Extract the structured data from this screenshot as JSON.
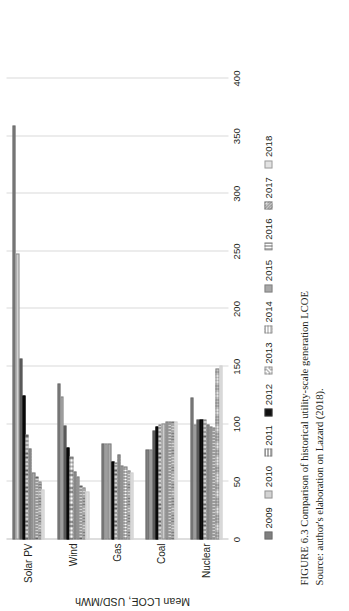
{
  "figure": {
    "number_label": "FIGURE 6.3",
    "caption": "Comparison of historical utility-scale generation LCOE",
    "source": "Source: author's elaboration on Lazard (2018)."
  },
  "chart_data": {
    "type": "bar",
    "orientation": "horizontal",
    "title": "",
    "xlabel": "Mean LCOE, USD/MWh",
    "ylabel": "",
    "axis_title": "Mean LCOE, USD/MWh",
    "categories": [
      "Solar PV",
      "Wind",
      "Gas",
      "Coal",
      "Nuclear"
    ],
    "tick_labels": [
      "0",
      "50",
      "100",
      "150",
      "200",
      "250",
      "300",
      "350",
      "400"
    ],
    "ticks": [
      0,
      50,
      100,
      150,
      200,
      250,
      300,
      350,
      400
    ],
    "xlim": [
      0,
      400
    ],
    "grid": true,
    "legend_position": "bottom",
    "legend": [
      "2009",
      "2010",
      "2011",
      "2012",
      "2013",
      "2014",
      "2015",
      "2016",
      "2017",
      "2018"
    ],
    "series": [
      {
        "name": "2009",
        "values": [
          359,
          135,
          83,
          78,
          123
        ]
      },
      {
        "name": "2010",
        "values": [
          248,
          124,
          83,
          78,
          100
        ]
      },
      {
        "name": "2011",
        "values": [
          157,
          99,
          83,
          95,
          104
        ]
      },
      {
        "name": "2012",
        "values": [
          125,
          80,
          68,
          98,
          104
        ]
      },
      {
        "name": "2013",
        "values": [
          91,
          72,
          67,
          100,
          104
        ]
      },
      {
        "name": "2014",
        "values": [
          79,
          59,
          74,
          101,
          100
        ]
      },
      {
        "name": "2015",
        "values": [
          58,
          55,
          64,
          102,
          98
        ]
      },
      {
        "name": "2016",
        "values": [
          55,
          47,
          63,
          102,
          97
        ]
      },
      {
        "name": "2017",
        "values": [
          50,
          45,
          60,
          102,
          148
        ]
      },
      {
        "name": "2018",
        "values": [
          43,
          42,
          58,
          102,
          151
        ]
      }
    ]
  },
  "colors": {
    "grid": "#d9d9d9",
    "axis": "#bdbdbd",
    "text": "#231f20"
  }
}
